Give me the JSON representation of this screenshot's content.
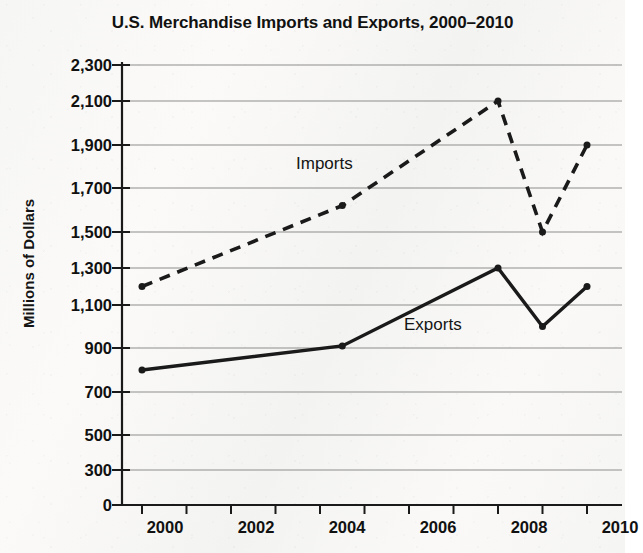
{
  "chart_data": {
    "type": "line",
    "title": "U.S. Merchandise Imports and Exports, 2000–2010",
    "xlabel": "",
    "ylabel": "Millions of Dollars",
    "grid": true,
    "legend_position": "inline-annotation",
    "x": [
      2000,
      2004.5,
      2008,
      2009,
      2010
    ],
    "xlim": [
      2000,
      2010
    ],
    "ylim": [
      0,
      2300
    ],
    "y_ticks": [
      "0",
      "300",
      "500",
      "700",
      "900",
      "1,100",
      "1,300",
      "1,500",
      "1,700",
      "1,900",
      "2,100",
      "2,300"
    ],
    "x_ticks": [
      "2000",
      "2002",
      "2004",
      "2006",
      "2008",
      "2010"
    ],
    "x_minor_ticks": [
      "2001",
      "2003",
      "2005",
      "2007",
      "2009"
    ],
    "series": [
      {
        "name": "Imports",
        "style": "dashed",
        "color": "#1a1a1a",
        "values": [
          1200,
          1620,
          2100,
          1500,
          1900
        ]
      },
      {
        "name": "Exports",
        "style": "solid",
        "color": "#1a1a1a",
        "values": [
          800,
          910,
          1300,
          1000,
          1200
        ]
      }
    ],
    "annotations": [
      {
        "text": "Imports",
        "x": 2004.0,
        "y": 1770
      },
      {
        "text": "Exports",
        "x": 2006.6,
        "y": 1040
      }
    ]
  },
  "axis": {
    "y_label": "Millions of Dollars"
  }
}
